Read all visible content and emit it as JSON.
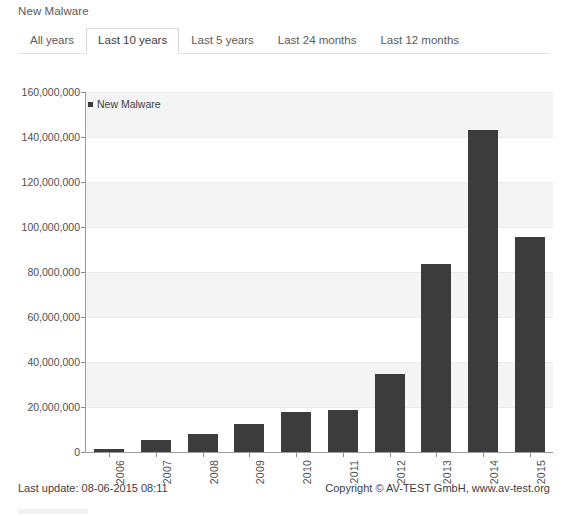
{
  "header": {
    "title": "New Malware"
  },
  "tabs": [
    {
      "label": "All years",
      "active": false
    },
    {
      "label": "Last 10 years",
      "active": true
    },
    {
      "label": "Last 5 years",
      "active": false
    },
    {
      "label": "Last 24 months",
      "active": false
    },
    {
      "label": "Last 12 months",
      "active": false
    }
  ],
  "footer": {
    "last_update": "Last update: 08-06-2015 08:11",
    "copyright": "Copyright © AV-TEST GmbH, www.av-test.org"
  },
  "colors": {
    "bar": "#3c3c3c",
    "band": "#f4f4f4",
    "axis": "#9a9a9a",
    "text": "#4f4f4f",
    "tab_active_border": "#d8d8d8"
  },
  "chart_data": {
    "type": "bar",
    "title": "New Malware",
    "xlabel": "",
    "ylabel": "",
    "legend": [
      "New Malware"
    ],
    "legend_position": "top-left-inside",
    "grid": true,
    "ylim": [
      0,
      160000000
    ],
    "ytick_labels": [
      "0",
      "20,000,000",
      "40,000,000",
      "60,000,000",
      "80,000,000",
      "100,000,000",
      "120,000,000",
      "140,000,000",
      "160,000,000"
    ],
    "ytick_values": [
      0,
      20000000,
      40000000,
      60000000,
      80000000,
      100000000,
      120000000,
      140000000,
      160000000
    ],
    "categories": [
      "2006",
      "2007",
      "2008",
      "2009",
      "2010",
      "2011",
      "2012",
      "2013",
      "2014",
      "2015"
    ],
    "series": [
      {
        "name": "New Malware",
        "values": [
          1300000,
          5500000,
          8000000,
          12500000,
          18000000,
          18800000,
          34500000,
          83500000,
          143000000,
          95500000
        ]
      }
    ]
  }
}
